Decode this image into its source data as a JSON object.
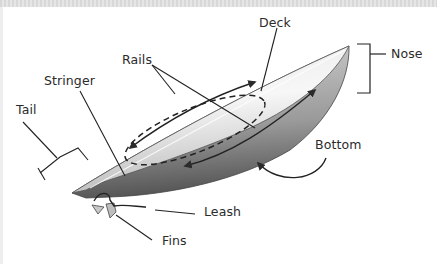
{
  "diagram": {
    "labels": {
      "deck": "Deck",
      "nose": "Nose",
      "rails": "Rails",
      "stringer": "Stringer",
      "tail": "Tail",
      "bottom": "Bottom",
      "leash": "Leash",
      "fins": "Fins"
    },
    "colors": {
      "board_light": "#f2f2f2",
      "board_mid": "#c8c8c8",
      "board_dark": "#6e6e6e",
      "line": "#2b2b2b",
      "text": "#2b2b2b"
    }
  }
}
